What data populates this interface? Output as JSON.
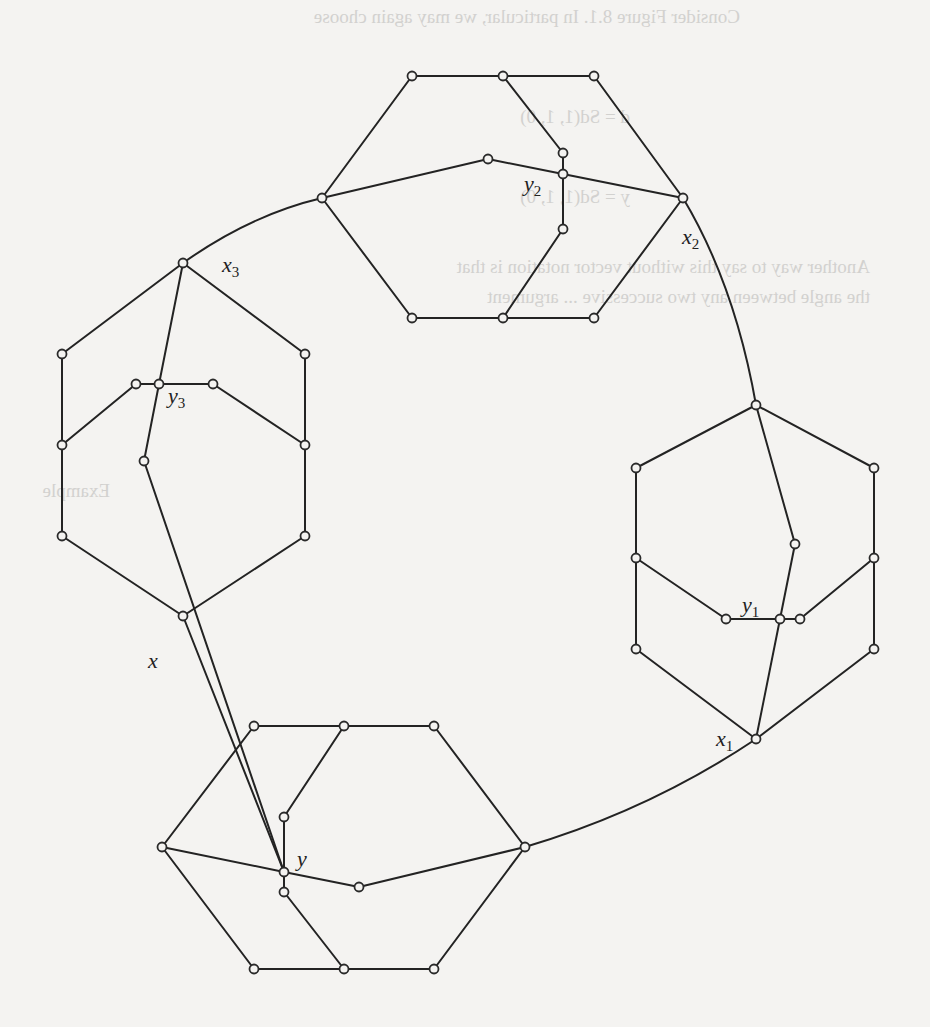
{
  "figure": {
    "labels": [
      {
        "id": "x",
        "base": "x",
        "sub": ""
      },
      {
        "id": "y",
        "base": "y",
        "sub": ""
      },
      {
        "id": "x1",
        "base": "x",
        "sub": "1"
      },
      {
        "id": "y1",
        "base": "y",
        "sub": "1"
      },
      {
        "id": "x2",
        "base": "x",
        "sub": "2"
      },
      {
        "id": "y2",
        "base": "y",
        "sub": "2"
      },
      {
        "id": "x3",
        "base": "x",
        "sub": "3"
      },
      {
        "id": "y3",
        "base": "y",
        "sub": "3"
      }
    ],
    "hexagons": [
      "top",
      "left",
      "right",
      "bottom"
    ],
    "vertex_count": 44,
    "colors": {
      "ink": "#232323",
      "paper": "#f4f3f1",
      "bleed_through": "#d2d1cf"
    }
  },
  "bleed_through_text": [
    "Consider Figure 8.1. In particular, we may again choose",
    "d = Sd(1, 1, 0)",
    "y = Sd(1, 1, 0)",
    "Another way to say this without vector notation is that",
    "the angle between any two successive ... argument",
    "Example"
  ]
}
